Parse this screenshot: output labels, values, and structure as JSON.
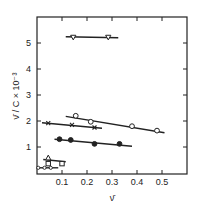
{
  "chart_data": {
    "type": "scatter",
    "title": "",
    "xlabel": "ν̄",
    "ylabel": "ν̄ / C × 10⁻³",
    "xlim": [
      0,
      0.6
    ],
    "ylim": [
      0,
      5.9
    ],
    "xticks": [
      0.1,
      0.2,
      0.3,
      0.4,
      0.5
    ],
    "xtick_labels": [
      "0.1",
      "0.2",
      "0.3",
      "0.4",
      "0.5"
    ],
    "yticks": [
      1,
      2,
      3,
      4,
      5
    ],
    "ytick_labels": [
      "1",
      "2",
      "3",
      "4",
      "5"
    ],
    "grid": false,
    "legend": "none",
    "series": [
      {
        "name": "inverted-triangles",
        "marker": "inverted-triangle",
        "filled": false,
        "x": [
          0.145,
          0.285
        ],
        "y": [
          5.22,
          5.22
        ],
        "fit_line": {
          "x": [
            0.115,
            0.325
          ],
          "y": [
            5.24,
            5.2
          ]
        }
      },
      {
        "name": "open-circles",
        "marker": "circle",
        "filled": false,
        "x": [
          0.155,
          0.215,
          0.38,
          0.48
        ],
        "y": [
          2.2,
          1.97,
          1.8,
          1.63
        ],
        "fit_line": {
          "x": [
            0.115,
            0.51
          ],
          "y": [
            2.18,
            1.55
          ]
        }
      },
      {
        "name": "crosses",
        "marker": "cross",
        "filled": true,
        "x": [
          0.045,
          0.14,
          0.23
        ],
        "y": [
          1.92,
          1.85,
          1.75
        ],
        "fit_line": {
          "x": [
            0.02,
            0.26
          ],
          "y": [
            1.93,
            1.72
          ]
        }
      },
      {
        "name": "filled-circles",
        "marker": "circle",
        "filled": true,
        "x": [
          0.09,
          0.135,
          0.23,
          0.33
        ],
        "y": [
          1.3,
          1.27,
          1.12,
          1.12
        ],
        "fit_line": {
          "x": [
            0.07,
            0.38
          ],
          "y": [
            1.3,
            1.03
          ]
        }
      },
      {
        "name": "triangles",
        "marker": "triangle",
        "filled": false,
        "x": [
          0.045
        ],
        "y": [
          0.58
        ],
        "fit_line": {
          "x": [
            0.025,
            0.115
          ],
          "y": [
            0.52,
            0.43
          ]
        }
      },
      {
        "name": "squares",
        "marker": "square",
        "filled": false,
        "x": [
          0.045,
          0.1
        ],
        "y": [
          0.36,
          0.36
        ],
        "fit_line": null
      },
      {
        "name": "crossed-circles",
        "marker": "small-circle",
        "filled": false,
        "x": [
          0.005,
          0.03,
          0.055
        ],
        "y": [
          0.2,
          0.2,
          0.2
        ],
        "fit_line": {
          "x": [
            0.0,
            0.085
          ],
          "y": [
            0.2,
            0.2
          ]
        }
      }
    ]
  }
}
